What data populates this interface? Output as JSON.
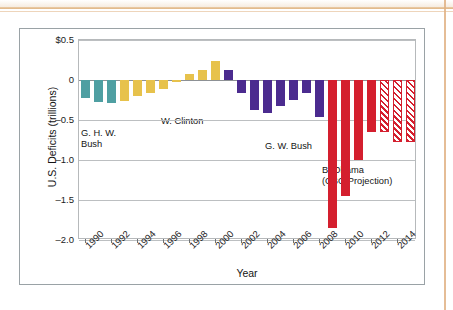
{
  "chart_data": {
    "type": "bar",
    "title": "",
    "xlabel": "Year",
    "ylabel": "U.S. Deficits (trillions)",
    "ylim": [
      -2.0,
      0.5
    ],
    "xlim": [
      1989.5,
      2015.5
    ],
    "grid": true,
    "legend": "none",
    "y_ticks": [
      "$0.5",
      "0",
      "–0.5",
      "–1.0",
      "–1.5",
      "–2.0"
    ],
    "y_tick_values": [
      0.5,
      0,
      -0.5,
      -1.0,
      -1.5,
      -2.0
    ],
    "x_ticks": [
      "1990",
      "1992",
      "1994",
      "1996",
      "1998",
      "2000",
      "2002",
      "2004",
      "2006",
      "2008",
      "2010",
      "2012",
      "2014"
    ],
    "x_tick_values": [
      1990,
      1992,
      1994,
      1996,
      1998,
      2000,
      2002,
      2004,
      2006,
      2008,
      2010,
      2012,
      2014
    ],
    "categories": [
      1990,
      1991,
      1992,
      1993,
      1994,
      1995,
      1996,
      1997,
      1998,
      1999,
      2000,
      2001,
      2002,
      2003,
      2004,
      2005,
      2006,
      2007,
      2008,
      2009,
      2010,
      2011,
      2012,
      2013,
      2014,
      2015
    ],
    "values": [
      -0.22,
      -0.27,
      -0.29,
      -0.26,
      -0.2,
      -0.16,
      -0.11,
      -0.02,
      0.07,
      0.12,
      0.24,
      0.13,
      -0.16,
      -0.38,
      -0.41,
      -0.32,
      -0.25,
      -0.16,
      -0.46,
      -1.85,
      -1.45,
      -1.0,
      -0.65,
      -0.65,
      -0.78,
      -0.78
    ],
    "series_groups": [
      {
        "name": "G. H. W. Bush",
        "color": "#4f9fa2",
        "years": [
          1990,
          1991,
          1992
        ],
        "hatched": false
      },
      {
        "name": "W. Clinton",
        "color": "#e7c24c",
        "years": [
          1993,
          1994,
          1995,
          1996,
          1997,
          1998,
          1999,
          2000
        ],
        "hatched": false
      },
      {
        "name": "G. W. Bush",
        "color": "#4b2b8f",
        "years": [
          2001,
          2002,
          2003,
          2004,
          2005,
          2006,
          2007,
          2008
        ],
        "hatched": false
      },
      {
        "name": "B. Obama",
        "color": "#d41f2e",
        "years": [
          2009,
          2010,
          2011,
          2012
        ],
        "hatched": false
      },
      {
        "name": "B. Obama (CBO Projection)",
        "color": "#d41f2e",
        "years": [
          2013,
          2014,
          2015
        ],
        "hatched": true
      }
    ]
  },
  "annotations": [
    {
      "id": "ghwbush",
      "line1": "G. H. W.",
      "line2": "Bush"
    },
    {
      "id": "clinton",
      "line1": "W. Clinton",
      "line2": ""
    },
    {
      "id": "gwbush",
      "line1": "G. W. Bush",
      "line2": ""
    },
    {
      "id": "obama",
      "line1": "B. Obama",
      "line2": "(CBO Projection)"
    }
  ],
  "axes": {
    "y_title": "U.S. Deficits (trillions)",
    "x_title": "Year"
  },
  "colors": {
    "ghw_bush": "#4f9fa2",
    "clinton": "#e7c24c",
    "gw_bush": "#4b2b8f",
    "obama": "#d41f2e",
    "grid": "#bcbfc1",
    "frame": "#9aa2a6"
  }
}
